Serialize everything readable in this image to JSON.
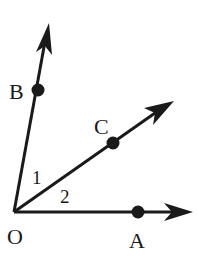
{
  "diagram": {
    "type": "geometry-angles",
    "points": {
      "O": {
        "label": "O",
        "x": 14,
        "y": 212
      },
      "A": {
        "label": "A",
        "x": 138,
        "y": 212
      },
      "B": {
        "label": "B",
        "x": 38,
        "y": 90
      },
      "C": {
        "label": "C",
        "x": 113,
        "y": 143
      }
    },
    "rays": [
      {
        "name": "OA",
        "from": "O",
        "through": "A"
      },
      {
        "name": "OB",
        "from": "O",
        "through": "B"
      },
      {
        "name": "OC",
        "from": "O",
        "through": "C"
      }
    ],
    "angle_labels": {
      "angle1": "1",
      "angle2": "2"
    },
    "colors": {
      "stroke": "#1a1a1a",
      "background": "#ffffff"
    }
  }
}
